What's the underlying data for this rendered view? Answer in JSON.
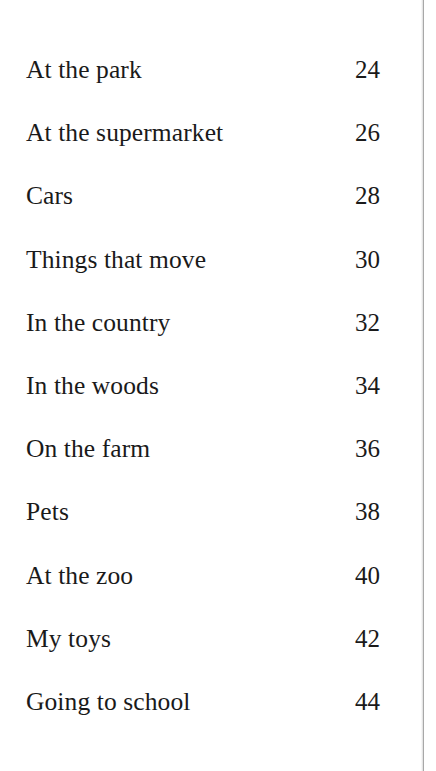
{
  "page": {
    "kind": "book-table-of-contents",
    "background_color": "#ffffff",
    "text_color": "#1a1a1a",
    "scan_edge_color": "#9a9a9a"
  },
  "contents": {
    "entries": [
      {
        "title": "At the park",
        "page": "24"
      },
      {
        "title": "At the supermarket",
        "page": "26"
      },
      {
        "title": "Cars",
        "page": "28"
      },
      {
        "title": "Things that move",
        "page": "30"
      },
      {
        "title": "In the country",
        "page": "32"
      },
      {
        "title": "In the woods",
        "page": "34"
      },
      {
        "title": "On the farm",
        "page": "36"
      },
      {
        "title": "Pets",
        "page": "38"
      },
      {
        "title": "At the zoo",
        "page": "40"
      },
      {
        "title": "My toys",
        "page": "42"
      },
      {
        "title": "Going to school",
        "page": "44"
      }
    ]
  }
}
